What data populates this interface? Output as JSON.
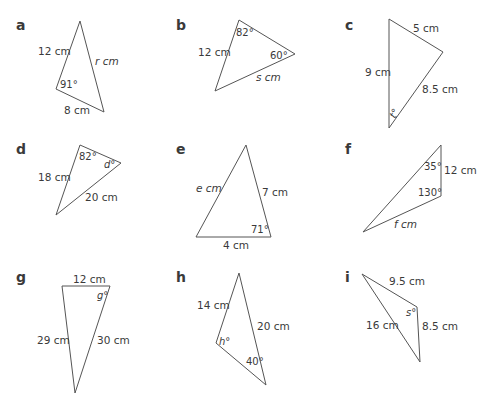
{
  "colors": {
    "stroke": "#555555",
    "text": "#3a3a3a",
    "background": "#ffffff"
  },
  "triangles": [
    {
      "id": "a",
      "letter": "a",
      "sides": {
        "s1": "12 cm",
        "s2": "r cm",
        "s3": "8 cm"
      },
      "angles": {
        "a1": "91°"
      }
    },
    {
      "id": "b",
      "letter": "b",
      "sides": {
        "s1": "12 cm",
        "s2": "s cm"
      },
      "angles": {
        "a1": "82°",
        "a2": "60°"
      }
    },
    {
      "id": "c",
      "letter": "c",
      "sides": {
        "s1": "5 cm",
        "s2": "9 cm",
        "s3": "8.5 cm"
      },
      "angles": {
        "a1": "t°"
      }
    },
    {
      "id": "d",
      "letter": "d",
      "sides": {
        "s1": "18 cm",
        "s2": "20 cm"
      },
      "angles": {
        "a1": "82°",
        "a2": "d°"
      }
    },
    {
      "id": "e",
      "letter": "e",
      "sides": {
        "s1": "e cm",
        "s2": "7 cm",
        "s3": "4 cm"
      },
      "angles": {
        "a1": "71°"
      }
    },
    {
      "id": "f",
      "letter": "f",
      "sides": {
        "s1": "12 cm",
        "s2": "f cm"
      },
      "angles": {
        "a1": "35°",
        "a2": "130°"
      }
    },
    {
      "id": "g",
      "letter": "g",
      "sides": {
        "s1": "12 cm",
        "s2": "29 cm",
        "s3": "30 cm"
      },
      "angles": {
        "a1": "g°"
      }
    },
    {
      "id": "h",
      "letter": "h",
      "sides": {
        "s1": "14 cm",
        "s2": "20 cm"
      },
      "angles": {
        "a1": "h°",
        "a2": "40°"
      }
    },
    {
      "id": "i",
      "letter": "i",
      "sides": {
        "s1": "9.5 cm",
        "s2": "16 cm",
        "s3": "8.5 cm"
      },
      "angles": {
        "a1": "s°"
      }
    }
  ]
}
